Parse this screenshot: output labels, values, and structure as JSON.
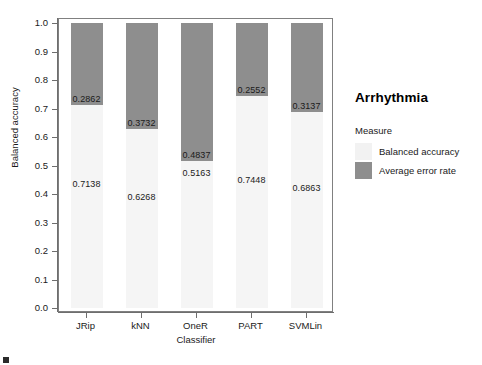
{
  "chart_data": {
    "type": "bar",
    "subtype": "stacked-100-percent",
    "title": "Arrhythmia",
    "xlabel": "Classifier",
    "ylabel": "Balanced accuracy",
    "ylim": [
      0.0,
      1.0
    ],
    "grid": false,
    "legend_position": "right",
    "legend_title": "Measure",
    "categories": [
      "JRip",
      "kNN",
      "OneR",
      "PART",
      "SVMLin"
    ],
    "ytick_labels": [
      "0.0",
      "0.1",
      "0.2",
      "0.3",
      "0.4",
      "0.5",
      "0.6",
      "0.7",
      "0.8",
      "0.9",
      "1.0"
    ],
    "ytick_values": [
      0.0,
      0.1,
      0.2,
      0.3,
      0.4,
      0.5,
      0.6,
      0.7,
      0.8,
      0.9,
      1.0
    ],
    "series": [
      {
        "name": "Balanced accuracy",
        "color": "#f5f5f5",
        "values": [
          0.7138,
          0.6268,
          0.5163,
          0.7448,
          0.6863
        ],
        "labels": [
          "0.7138",
          "0.6268",
          "0.5163",
          "0.7448",
          "0.6863"
        ]
      },
      {
        "name": "Average error rate",
        "color": "#8e8e8e",
        "values": [
          0.2862,
          0.3732,
          0.4837,
          0.2552,
          0.3137
        ],
        "labels": [
          "0.2862",
          "0.3732",
          "0.4837",
          "0.2552",
          "0.3137"
        ]
      }
    ]
  },
  "legend": {
    "title": "Arrhythmia",
    "subtitle": "Measure",
    "items": [
      {
        "label": "Balanced accuracy",
        "color": "#f2f2f2"
      },
      {
        "label": "Average error rate",
        "color": "#8e8e8e"
      }
    ]
  }
}
